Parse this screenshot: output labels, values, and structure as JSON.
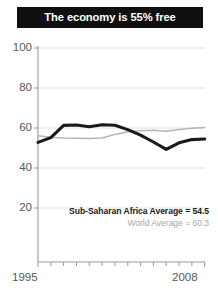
{
  "title": "The economy is 55% free",
  "axis": {
    "y_ticks": [
      "100",
      "80",
      "60",
      "40",
      "20"
    ],
    "x_start": "1995",
    "x_end": "2008"
  },
  "legend": {
    "series_1": "Sub-Saharan Africa Average = 54.5",
    "series_2": "World Average = 60.3"
  },
  "colors": {
    "title_bar": "#101010",
    "title_text": "#ffffff",
    "series_1": "#1a1a1a",
    "series_2": "#b5b5b5",
    "axis": "#9a9a9a",
    "gridline": "#d8d8d8",
    "tick_label": "#58585a"
  },
  "chart_data": {
    "type": "line",
    "title": "The economy is 55% free",
    "xlabel": "",
    "ylabel": "",
    "xlim": [
      1995,
      2008
    ],
    "ylim": [
      0,
      100
    ],
    "yticks": [
      20,
      40,
      60,
      80,
      100
    ],
    "xticks": [
      1995,
      1996,
      1997,
      1998,
      1999,
      2000,
      2001,
      2002,
      2003,
      2004,
      2005,
      2006,
      2007,
      2008
    ],
    "xtick_labels_shown": [
      "1995",
      "2008"
    ],
    "grid": true,
    "legend_position": "inside-lower-right",
    "x": [
      1995,
      1996,
      1997,
      1998,
      1999,
      2000,
      2001,
      2002,
      2003,
      2004,
      2005,
      2006,
      2007,
      2008
    ],
    "series": [
      {
        "name": "Sub-Saharan Africa Average",
        "label": "Sub-Saharan Africa Average = 54.5",
        "color": "#1a1a1a",
        "final_value": 54.5,
        "values": [
          52.8,
          55.2,
          61.3,
          61.5,
          60.6,
          61.6,
          61.4,
          59.2,
          56.4,
          53.0,
          49.3,
          52.6,
          54.2,
          54.5
        ]
      },
      {
        "name": "World Average",
        "label": "World Average = 60.3",
        "color": "#b5b5b5",
        "final_value": 60.3,
        "values": [
          56.1,
          55.4,
          55.0,
          54.9,
          54.8,
          55.0,
          56.8,
          58.1,
          58.6,
          58.9,
          58.4,
          59.2,
          59.9,
          60.3
        ]
      }
    ]
  }
}
